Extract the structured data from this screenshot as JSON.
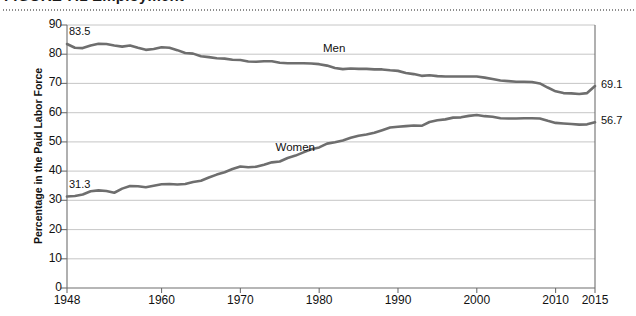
{
  "figure": {
    "top_partial_heading": "FIGURE 7.1   Employment",
    "ylabel": "Percentage in the Paid Labor Force"
  },
  "chart_data": {
    "type": "line",
    "title": "",
    "xlabel": "",
    "ylabel": "Percentage in the Paid Labor Force",
    "xlim": [
      1948,
      2015
    ],
    "ylim": [
      0,
      90
    ],
    "ytick_step": 10,
    "yticks": [
      0,
      10,
      20,
      30,
      40,
      50,
      60,
      70,
      80,
      90
    ],
    "xticks": [
      1948,
      1960,
      1970,
      1980,
      1990,
      2000,
      2010,
      2015
    ],
    "grid": "horizontal",
    "legend": "inline-labels",
    "line_color": "#6e6e6e",
    "annotations": [
      {
        "text": "83.5",
        "series": "Men",
        "x": 1948,
        "y": 83.5,
        "position": "above-left"
      },
      {
        "text": "31.3",
        "series": "Women",
        "x": 1948,
        "y": 31.3,
        "position": "above-left"
      },
      {
        "text": "69.1",
        "series": "Men",
        "x": 2015,
        "y": 69.1,
        "position": "right"
      },
      {
        "text": "56.7",
        "series": "Women",
        "x": 2015,
        "y": 56.7,
        "position": "right"
      },
      {
        "text": "Men",
        "series": "Men",
        "x": 1982,
        "y": 81.5,
        "position": "above"
      },
      {
        "text": "Women",
        "series": "Women",
        "x": 1977,
        "y": 47.5,
        "position": "above-left"
      }
    ],
    "x": [
      1948,
      1949,
      1950,
      1951,
      1952,
      1953,
      1954,
      1955,
      1956,
      1957,
      1958,
      1959,
      1960,
      1961,
      1962,
      1963,
      1964,
      1965,
      1966,
      1967,
      1968,
      1969,
      1970,
      1971,
      1972,
      1973,
      1974,
      1975,
      1976,
      1977,
      1978,
      1979,
      1980,
      1981,
      1982,
      1983,
      1984,
      1985,
      1986,
      1987,
      1988,
      1989,
      1990,
      1991,
      1992,
      1993,
      1994,
      1995,
      1996,
      1997,
      1998,
      1999,
      2000,
      2001,
      2002,
      2003,
      2004,
      2005,
      2006,
      2007,
      2008,
      2009,
      2010,
      2011,
      2012,
      2013,
      2014,
      2015
    ],
    "series": [
      {
        "name": "Men",
        "values": [
          83.5,
          82.2,
          82.1,
          83.0,
          83.6,
          83.5,
          83.0,
          82.6,
          83.0,
          82.2,
          81.5,
          81.8,
          82.4,
          82.2,
          81.4,
          80.4,
          80.2,
          79.3,
          79.0,
          78.6,
          78.5,
          78.1,
          78.0,
          77.5,
          77.4,
          77.6,
          77.6,
          77.1,
          76.9,
          76.9,
          76.9,
          76.8,
          76.6,
          76.1,
          75.3,
          74.9,
          75.1,
          75.0,
          75.0,
          74.8,
          74.8,
          74.5,
          74.3,
          73.6,
          73.2,
          72.6,
          72.8,
          72.5,
          72.4,
          72.4,
          72.4,
          72.4,
          72.4,
          72.0,
          71.5,
          71.0,
          70.8,
          70.6,
          70.6,
          70.5,
          70.0,
          68.6,
          67.3,
          66.7,
          66.6,
          66.4,
          66.7,
          69.1
        ]
      },
      {
        "name": "Women",
        "values": [
          31.3,
          31.5,
          32.0,
          33.1,
          33.4,
          33.2,
          32.6,
          34.0,
          34.9,
          34.8,
          34.5,
          35.0,
          35.5,
          35.6,
          35.4,
          35.6,
          36.3,
          36.7,
          37.8,
          38.8,
          39.6,
          40.7,
          41.6,
          41.3,
          41.5,
          42.2,
          43.0,
          43.3,
          44.5,
          45.3,
          46.4,
          47.5,
          48.1,
          49.4,
          49.9,
          50.5,
          51.4,
          52.1,
          52.5,
          53.1,
          54.0,
          54.9,
          55.2,
          55.4,
          55.6,
          55.5,
          56.8,
          57.4,
          57.7,
          58.3,
          58.4,
          58.9,
          59.2,
          58.8,
          58.6,
          58.1,
          58.0,
          58.0,
          58.1,
          58.1,
          58.0,
          57.2,
          56.5,
          56.3,
          56.1,
          55.9,
          56.0,
          56.7
        ]
      }
    ]
  }
}
